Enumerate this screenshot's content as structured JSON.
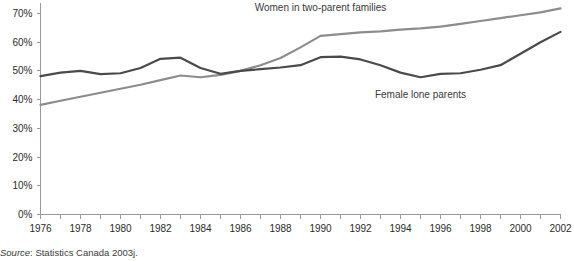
{
  "chart_data": {
    "type": "line",
    "title": "",
    "subtitle": "",
    "xlabel": "",
    "ylabel": "",
    "x": [
      1976,
      1977,
      1978,
      1979,
      1980,
      1981,
      1982,
      1983,
      1984,
      1985,
      1986,
      1987,
      1988,
      1989,
      1990,
      1991,
      1992,
      1993,
      1994,
      1995,
      1996,
      1997,
      1998,
      1999,
      2000,
      2001,
      2002
    ],
    "xlim": [
      1976,
      2002
    ],
    "ylim": [
      0,
      70
    ],
    "grid": false,
    "legend_position": "inline-annotation",
    "y_ticks": [
      0,
      10,
      20,
      30,
      40,
      50,
      60,
      70
    ],
    "y_tick_labels": [
      "0%",
      "10%",
      "20%",
      "30%",
      "40%",
      "50%",
      "60%",
      "70%"
    ],
    "x_ticks": [
      1976,
      1977,
      1978,
      1979,
      1980,
      1981,
      1982,
      1983,
      1984,
      1985,
      1986,
      1987,
      1988,
      1989,
      1990,
      1991,
      1992,
      1993,
      1994,
      1995,
      1996,
      1997,
      1998,
      1999,
      2000,
      2001,
      2002
    ],
    "x_tick_labels": [
      "1976",
      "",
      "1978",
      "",
      "1980",
      "",
      "1982",
      "",
      "1984",
      "",
      "1986",
      "",
      "1988",
      "",
      "1990",
      "",
      "1992",
      "",
      "1994",
      "",
      "1996",
      "",
      "1998",
      "",
      "2000",
      "",
      "2002"
    ],
    "series": [
      {
        "name": "Women in two-parent families",
        "color": "#8c8c8c",
        "annotation": "Women in two-parent families",
        "values": [
          38.2,
          39.6,
          41.0,
          42.4,
          43.8,
          45.2,
          46.8,
          48.4,
          47.8,
          48.6,
          50.0,
          52.0,
          54.5,
          58.2,
          62.2,
          62.8,
          63.4,
          63.8,
          64.4,
          64.8,
          65.4,
          66.4,
          67.4,
          68.4,
          69.4,
          70.4,
          71.8
        ]
      },
      {
        "name": "Female lone parents",
        "color": "#4a4a4a",
        "annotation": "Female lone parents",
        "values": [
          48.2,
          49.4,
          50.0,
          48.9,
          49.2,
          51.0,
          54.2,
          54.6,
          51.0,
          49.0,
          50.0,
          50.6,
          51.2,
          52.0,
          54.8,
          55.0,
          54.0,
          52.0,
          49.4,
          47.8,
          49.0,
          49.2,
          50.4,
          52.0,
          56.0,
          60.0,
          63.6
        ]
      }
    ],
    "annotations": [
      {
        "text": "Women in two-parent families",
        "x": 1990,
        "y": 71.0
      },
      {
        "text": "Female lone parents",
        "x": 1995,
        "y": 40.6
      }
    ],
    "source": {
      "prefix": "Source",
      "separator": ": ",
      "text": "Statistics Canada 2003j."
    }
  }
}
